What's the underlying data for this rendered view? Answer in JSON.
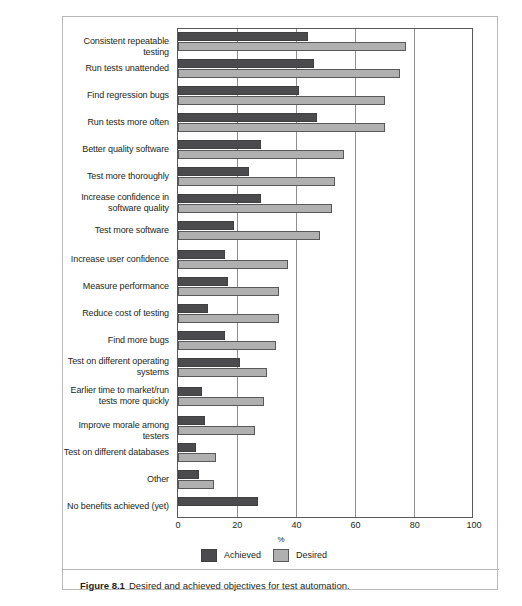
{
  "figure": {
    "caption_label": "Figure 8.1",
    "caption_text": "Desired and achieved objectives for test automation."
  },
  "legend": {
    "achieved_label": "Achieved",
    "desired_label": "Desired",
    "achieved_color": "#4b4b4d",
    "desired_color": "#b0b0b0"
  },
  "chart_data": {
    "type": "bar",
    "orientation": "horizontal",
    "title": "",
    "xlabel": "%",
    "ylabel": "",
    "xlim": [
      0,
      100
    ],
    "xticks": [
      "0",
      "20",
      "40",
      "60",
      "80",
      "100"
    ],
    "grid": true,
    "legend_position": "bottom",
    "categories": [
      "Consistent repeatable testing",
      "Run tests unattended",
      "Find regression bugs",
      "Run tests more often",
      "Better quality software",
      "Test more thoroughly",
      "Increase confidence in software quality",
      "Test more software",
      "Increase user confidence",
      "Measure performance",
      "Reduce cost of testing",
      "Find more bugs",
      "Test on different operating systems",
      "Earlier time to market/run tests more quickly",
      "Improve morale among testers",
      "Test on different databases",
      "Other",
      "No benefits achieved (yet)"
    ],
    "category_lines": [
      [
        "Consistent repeatable testing"
      ],
      [
        "Run tests unattended"
      ],
      [
        "Find regression bugs"
      ],
      [
        "Run tests more often"
      ],
      [
        "Better quality software"
      ],
      [
        "Test more thoroughly"
      ],
      [
        "Increase confidence in",
        "software quality"
      ],
      [
        "Test more software"
      ],
      [
        "Increase user confidence"
      ],
      [
        "Measure performance"
      ],
      [
        "Reduce cost of testing"
      ],
      [
        "Find more bugs"
      ],
      [
        "Test on different operating",
        "systems"
      ],
      [
        "Earlier time to market/run",
        "tests more quickly"
      ],
      [
        "Improve morale among testers"
      ],
      [
        "Test on different databases"
      ],
      [
        "Other"
      ],
      [
        "No benefits achieved (yet)"
      ]
    ],
    "series": [
      {
        "name": "Achieved",
        "color": "#4b4b4d",
        "values": [
          44,
          46,
          41,
          47,
          28,
          24,
          28,
          19,
          16,
          17,
          10,
          16,
          21,
          8,
          9,
          6,
          7,
          27
        ]
      },
      {
        "name": "Desired",
        "color": "#b0b0b0",
        "values": [
          77,
          75,
          70,
          70,
          56,
          53,
          52,
          48,
          37,
          34,
          34,
          33,
          30,
          29,
          26,
          13,
          12,
          0
        ]
      }
    ]
  }
}
